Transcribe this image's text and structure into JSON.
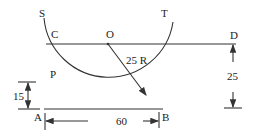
{
  "diagram": {
    "points": {
      "S": "S",
      "T": "T",
      "C": "C",
      "O": "O",
      "D": "D",
      "P": "P",
      "A": "A",
      "B": "B"
    },
    "dimensions": {
      "radius_label": "25 R",
      "left_height": "15",
      "right_height": "25",
      "base_length": "60"
    },
    "colors": {
      "line": "#333333",
      "background": "#ffffff"
    }
  }
}
